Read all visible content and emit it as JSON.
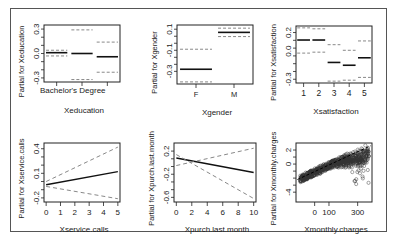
{
  "chart_data": [
    {
      "type": "categorical-effect",
      "title": "",
      "xlabel": "Xeducation",
      "ylabel": "Partial for Xeducation",
      "categories": [
        "Bachelor's Degree",
        "",
        ""
      ],
      "tick_labels_x": [
        "Bachelor's Degree"
      ],
      "yticks": [
        0.3,
        0.0,
        -0.3
      ],
      "ylim": [
        -0.35,
        0.35
      ],
      "estimate": [
        0.01,
        0.0,
        -0.04
      ],
      "upper": [
        0.04,
        0.29,
        0.14
      ],
      "lower": [
        -0.03,
        -0.32,
        -0.23
      ],
      "box": [
        44,
        25,
        120,
        82
      ],
      "row": 0
    },
    {
      "type": "categorical-effect",
      "title": "",
      "xlabel": "Xgender",
      "ylabel": "Partial for Xgender",
      "categories": [
        "F",
        "M"
      ],
      "tick_labels_x": [
        "F",
        "M"
      ],
      "yticks": [
        0.1,
        -0.1,
        -0.3
      ],
      "ylim": [
        -0.42,
        0.14
      ],
      "estimate": [
        -0.28,
        0.07
      ],
      "upper": [
        -0.09,
        0.11
      ],
      "lower": [
        -0.4,
        0.03
      ],
      "box": [
        177,
        25,
        253,
        84
      ],
      "row": 0
    },
    {
      "type": "categorical-effect",
      "title": "",
      "xlabel": "Xsatisfaction",
      "ylabel": "Partial for Xsatisfaction",
      "categories": [
        "1",
        "2",
        "3",
        "4",
        "5"
      ],
      "tick_labels_x": [
        "1",
        "2",
        "3",
        "4",
        "5"
      ],
      "yticks": [
        0.2,
        0.0,
        -0.3
      ],
      "ylim": [
        -0.34,
        0.27
      ],
      "estimate": [
        0.12,
        0.12,
        -0.12,
        -0.15,
        -0.07
      ],
      "upper": [
        0.25,
        0.24,
        0.07,
        0.01,
        0.11
      ],
      "lower": [
        -0.02,
        -0.01,
        -0.32,
        -0.31,
        -0.28
      ],
      "box": [
        296,
        26,
        372,
        83
      ],
      "row": 0
    },
    {
      "type": "line",
      "title": "",
      "xlabel": "Xservice.calls",
      "ylabel": "Partial for Xservice.calls",
      "x": [
        0,
        5
      ],
      "xticks": [
        0,
        1,
        2,
        3,
        4,
        5
      ],
      "yticks": [
        0.4,
        0.1,
        -0.2
      ],
      "xlim": [
        -0.15,
        5.15
      ],
      "ylim": [
        -0.25,
        0.47
      ],
      "series": [
        {
          "name": "fit",
          "values": [
            -0.04,
            0.12
          ],
          "style": "solid"
        },
        {
          "name": "upper",
          "values": [
            0.0,
            0.42
          ],
          "style": "dashed"
        },
        {
          "name": "lower",
          "values": [
            -0.06,
            -0.21
          ],
          "style": "dashed"
        }
      ],
      "box": [
        44,
        143,
        120,
        202
      ],
      "row": 1
    },
    {
      "type": "line",
      "title": "",
      "xlabel": "Xpurch.last.month",
      "ylabel": "Partial for Xpurch.last.month",
      "x": [
        0,
        10
      ],
      "xticks": [
        0,
        2,
        4,
        6,
        8,
        10
      ],
      "yticks": [
        0.2,
        -0.2,
        -0.6
      ],
      "xlim": [
        -0.3,
        10.3
      ],
      "ylim": [
        -0.68,
        0.34
      ],
      "series": [
        {
          "name": "fit",
          "values": [
            0.08,
            -0.17
          ],
          "style": "solid"
        },
        {
          "name": "upper",
          "values": [
            -0.05,
            0.25
          ],
          "style": "dashed"
        },
        {
          "name": "lower",
          "values": [
            0.14,
            -0.62
          ],
          "style": "dashed"
        }
      ],
      "box": [
        174,
        143,
        256,
        202
      ],
      "row": 1
    },
    {
      "type": "scatter",
      "title": "",
      "xlabel": "Xmonthly.charges",
      "ylabel": "Partial for Xmonthly.charges",
      "xticks": [
        0,
        100,
        300
      ],
      "yticks": [
        2,
        0,
        -4
      ],
      "xlim": [
        -130,
        400
      ],
      "ylim": [
        -5.4,
        3.0
      ],
      "fit_line": {
        "x": [
          -120,
          390
        ],
        "y": [
          -2.2,
          2.6
        ]
      },
      "box": [
        296,
        143,
        372,
        202
      ],
      "row": 1
    }
  ]
}
